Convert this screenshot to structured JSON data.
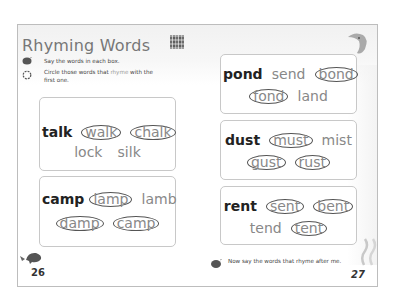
{
  "page": {
    "title": "Rhyming Words",
    "qr_icon": "qr-code-icon",
    "instructions": [
      {
        "icon": "speaking-bird-icon",
        "text": "Say the words in each box."
      },
      {
        "icon": "circle-pencil-icon",
        "text_before": "Circle those words that ",
        "highlight": "rhyme",
        "text_after": " with the first one."
      }
    ],
    "footer_instruction": {
      "icon": "speaking-bird-icon",
      "text": "Now say the words that rhyme after me."
    },
    "page_numbers": {
      "left": "26",
      "right": "27"
    },
    "decorations": [
      "dolphin-icon",
      "whale-icon",
      "steam-swirl-icon"
    ]
  },
  "boxes": [
    {
      "id": "talk",
      "lines": [
        [
          {
            "word": "talk",
            "key": true
          },
          {
            "word": "walk",
            "circled": true
          },
          {
            "word": "chalk",
            "circled": true
          }
        ],
        [
          {
            "word": "lock"
          },
          {
            "word": "silk"
          }
        ]
      ]
    },
    {
      "id": "camp",
      "lines": [
        [
          {
            "word": "camp",
            "key": true
          },
          {
            "word": "lamp",
            "circled": true
          },
          {
            "word": "lamb"
          }
        ],
        [
          {
            "word": "damp",
            "circled": true
          },
          {
            "word": "camp",
            "circled": true
          }
        ]
      ]
    },
    {
      "id": "pond",
      "lines": [
        [
          {
            "word": "pond",
            "key": true
          },
          {
            "word": "send"
          },
          {
            "word": "bond",
            "circled": true
          }
        ],
        [
          {
            "word": "fond",
            "circled": true
          },
          {
            "word": "land"
          }
        ]
      ]
    },
    {
      "id": "dust",
      "lines": [
        [
          {
            "word": "dust",
            "key": true
          },
          {
            "word": "must",
            "circled": true
          },
          {
            "word": "mist"
          }
        ],
        [
          {
            "word": "gust",
            "circled": true
          },
          {
            "word": "rust",
            "circled": true
          }
        ]
      ]
    },
    {
      "id": "rent",
      "lines": [
        [
          {
            "word": "rent",
            "key": true
          },
          {
            "word": "sent",
            "circled": true
          },
          {
            "word": "bent",
            "circled": true
          }
        ],
        [
          {
            "word": "tend"
          },
          {
            "word": "tent",
            "circled": true
          }
        ]
      ]
    }
  ],
  "colors": {
    "key_word": "#222222",
    "other_word": "#888888",
    "circle_stroke": "#555555",
    "box_border": "#c8c8c8",
    "title": "#777777"
  }
}
